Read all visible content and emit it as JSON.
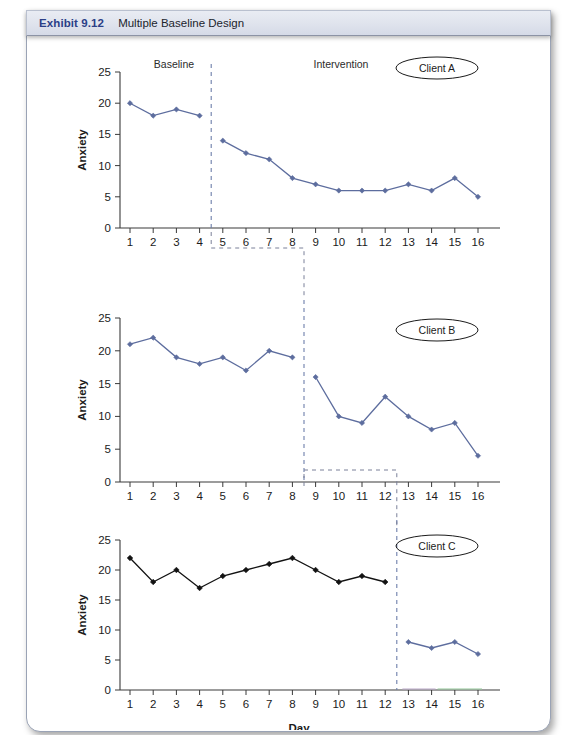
{
  "header": {
    "exhibit_number": "Exhibit 9.12",
    "title": "Multiple Baseline Design"
  },
  "axes": {
    "y_label": "Anxiety",
    "x_label": "Day",
    "y_ticks": [
      "0",
      "5",
      "10",
      "15",
      "20",
      "25"
    ],
    "x_ticks": [
      "1",
      "2",
      "3",
      "4",
      "5",
      "6",
      "7",
      "8",
      "9",
      "10",
      "11",
      "12",
      "13",
      "14",
      "15",
      "16"
    ]
  },
  "phase_labels": {
    "baseline": "Baseline",
    "intervention": "Intervention"
  },
  "clients": {
    "a": "Client A",
    "b": "Client B",
    "c": "Client C"
  },
  "colors": {
    "accent_blue": "#5d6d9e",
    "black_series": "#121212",
    "header_text": "#2b3f87",
    "phase_line": "#6d7fab",
    "connector": "#7b8099"
  },
  "chart_data": [
    {
      "type": "line",
      "title": "Client A",
      "xlabel": "",
      "ylabel": "Anxiety",
      "x": [
        1,
        2,
        3,
        4,
        5,
        6,
        7,
        8,
        9,
        10,
        11,
        12,
        13,
        14,
        15,
        16
      ],
      "ylim": [
        0,
        25
      ],
      "xlim": [
        1,
        16
      ],
      "grid": false,
      "legend": "none",
      "phase_change_after_x": 4,
      "phase_names": [
        "Baseline",
        "Intervention"
      ],
      "series": [
        {
          "name": "Baseline",
          "x": [
            1,
            2,
            3,
            4
          ],
          "values": [
            20,
            18,
            19,
            18
          ],
          "color": "#5d6d9e"
        },
        {
          "name": "Intervention",
          "x": [
            5,
            6,
            7,
            8,
            9,
            10,
            11,
            12,
            13,
            14,
            15,
            16
          ],
          "values": [
            14,
            12,
            11,
            8,
            7,
            6,
            6,
            6,
            7,
            6,
            8,
            5
          ],
          "color": "#5d6d9e"
        }
      ]
    },
    {
      "type": "line",
      "title": "Client B",
      "xlabel": "",
      "ylabel": "Anxiety",
      "x": [
        1,
        2,
        3,
        4,
        5,
        6,
        7,
        8,
        9,
        10,
        11,
        12,
        13,
        14,
        15,
        16
      ],
      "ylim": [
        0,
        25
      ],
      "xlim": [
        1,
        16
      ],
      "grid": false,
      "legend": "none",
      "phase_change_after_x": 8,
      "phase_names": [
        "Baseline",
        "Intervention"
      ],
      "series": [
        {
          "name": "Baseline",
          "x": [
            1,
            2,
            3,
            4,
            5,
            6,
            7,
            8
          ],
          "values": [
            21,
            22,
            19,
            18,
            19,
            17,
            20,
            19
          ],
          "color": "#5d6d9e"
        },
        {
          "name": "Intervention",
          "x": [
            9,
            10,
            11,
            12,
            13,
            14,
            15,
            16
          ],
          "values": [
            16,
            10,
            9,
            13,
            10,
            8,
            9,
            4
          ],
          "color": "#5d6d9e"
        }
      ]
    },
    {
      "type": "line",
      "title": "Client C",
      "xlabel": "Day",
      "ylabel": "Anxiety",
      "x": [
        1,
        2,
        3,
        4,
        5,
        6,
        7,
        8,
        9,
        10,
        11,
        12,
        13,
        14,
        15,
        16
      ],
      "ylim": [
        0,
        25
      ],
      "xlim": [
        1,
        16
      ],
      "grid": false,
      "legend": "none",
      "phase_change_after_x": 12,
      "phase_names": [
        "Baseline",
        "Intervention"
      ],
      "series": [
        {
          "name": "Baseline",
          "x": [
            1,
            2,
            3,
            4,
            5,
            6,
            7,
            8,
            9,
            10,
            11,
            12
          ],
          "values": [
            22,
            18,
            20,
            17,
            19,
            20,
            21,
            22,
            20,
            18,
            19,
            18
          ],
          "color": "#121212"
        },
        {
          "name": "Intervention",
          "x": [
            13,
            14,
            15,
            16
          ],
          "values": [
            8,
            7,
            8,
            6
          ],
          "color": "#5d6d9e"
        }
      ]
    }
  ]
}
